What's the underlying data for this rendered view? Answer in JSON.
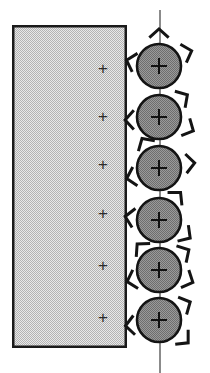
{
  "figure": {
    "title": "",
    "background_color": "#ffffff",
    "width": 210,
    "height": 373,
    "substrate": {
      "name": "stippled-rectangle",
      "x": 12,
      "y": 25,
      "width": 115,
      "height": 323,
      "fill_color": "#e8e8e8",
      "stipple_color": "#a9a9a9",
      "border_color": "#1a1a1a",
      "border_width": 2.5,
      "charge_symbol": "+",
      "charge_symbol_color": "#2b2b2b",
      "charge_symbol_count": 6,
      "charge_symbol_x": 103,
      "charge_symbols_y": [
        68,
        116,
        164,
        213,
        265,
        317
      ]
    },
    "axis_line": {
      "name": "vertical-axis-line",
      "x": 160,
      "y1": 10,
      "y2": 373,
      "color": "#5a5a5a",
      "width": 1.4
    },
    "particles": {
      "name": "particle-column",
      "count": 6,
      "center_x": 159,
      "radius": 22,
      "fill_color": "#9a9a9a",
      "dither_color": "#6e6e6e",
      "stroke_color": "#141414",
      "stroke_width": 2.6,
      "centers_y": [
        66,
        117,
        168,
        220,
        270,
        320
      ],
      "inner_mark": "crosshair-plus",
      "inner_mark_color": "#111111"
    },
    "chevrons": {
      "name": "radiating-chevron-arrowheads",
      "color": "#141414",
      "stroke_width": 3.0,
      "arm_length": 13,
      "half_angle_deg": 48,
      "items": [
        {
          "particle": 1,
          "angle_deg": -90,
          "distance": 37,
          "rotation_deg": -90
        },
        {
          "particle": 1,
          "angle_deg": -25,
          "distance": 36,
          "rotation_deg": -18
        },
        {
          "particle": 1,
          "angle_deg": 190,
          "distance": 33,
          "rotation_deg": 196
        },
        {
          "particle": 2,
          "angle_deg": -38,
          "distance": 36,
          "rotation_deg": -32
        },
        {
          "particle": 2,
          "angle_deg": 22,
          "distance": 37,
          "rotation_deg": 26
        },
        {
          "particle": 2,
          "angle_deg": 175,
          "distance": 34,
          "rotation_deg": 180
        },
        {
          "particle": 3,
          "angle_deg": -120,
          "distance": 34,
          "rotation_deg": -122
        },
        {
          "particle": 3,
          "angle_deg": -8,
          "distance": 36,
          "rotation_deg": -4
        },
        {
          "particle": 3,
          "angle_deg": 162,
          "distance": 34,
          "rotation_deg": 166
        },
        {
          "particle": 4,
          "angle_deg": -52,
          "distance": 35,
          "rotation_deg": -48
        },
        {
          "particle": 4,
          "angle_deg": 30,
          "distance": 36,
          "rotation_deg": 34
        },
        {
          "particle": 4,
          "angle_deg": 186,
          "distance": 34,
          "rotation_deg": 190
        },
        {
          "particle": 5,
          "angle_deg": -130,
          "distance": 34,
          "rotation_deg": -134
        },
        {
          "particle": 5,
          "angle_deg": -34,
          "distance": 36,
          "rotation_deg": -30
        },
        {
          "particle": 5,
          "angle_deg": 20,
          "distance": 36,
          "rotation_deg": 24
        },
        {
          "particle": 5,
          "angle_deg": 160,
          "distance": 34,
          "rotation_deg": 164
        },
        {
          "particle": 6,
          "angle_deg": -30,
          "distance": 36,
          "rotation_deg": -26
        },
        {
          "particle": 6,
          "angle_deg": 38,
          "distance": 37,
          "rotation_deg": 42
        },
        {
          "particle": 6,
          "angle_deg": 170,
          "distance": 34,
          "rotation_deg": 175
        }
      ]
    }
  }
}
